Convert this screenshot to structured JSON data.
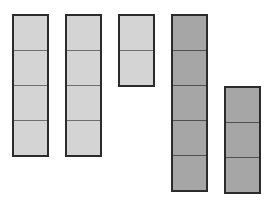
{
  "diagram": {
    "colors": {
      "light": "#d4d4d4",
      "dark": "#a6a6a6",
      "border": "#2b2b2b"
    },
    "columns": [
      {
        "id": 1,
        "cells": 4,
        "shade": "light",
        "x": 12,
        "top": 14
      },
      {
        "id": 2,
        "cells": 4,
        "shade": "light",
        "x": 65,
        "top": 14
      },
      {
        "id": 3,
        "cells": 2,
        "shade": "light",
        "x": 118,
        "top": 14
      },
      {
        "id": 4,
        "cells": 5,
        "shade": "dark",
        "x": 171,
        "top": 14
      },
      {
        "id": 5,
        "cells": 3,
        "shade": "dark",
        "x": 224,
        "top": 86
      }
    ]
  }
}
